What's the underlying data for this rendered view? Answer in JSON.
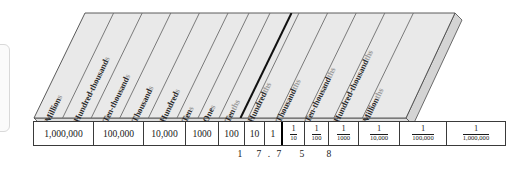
{
  "figure": {
    "colors": {
      "slab_top": "#e9e9e9",
      "slab_side": "#d8d8d8",
      "slab_front": "#e2e2e2",
      "rule_line": "#6d6d6d",
      "decimal_rule": "#111111",
      "outline": "#3a3a3a",
      "label_text": "#2b2b2b",
      "label_suffix": "#9b9b9b",
      "page_background": "#ffffff"
    },
    "decimal_point_marker": "thick-dark-line-between-ones-and-tenths"
  },
  "place_values": [
    {
      "name": "Millions",
      "stem": "Million",
      "suffix": "s",
      "value": "1,000,000",
      "kind": "whole",
      "digit": ""
    },
    {
      "name": "Hundred-thousands",
      "stem": "Hundred-thousand",
      "suffix": "s",
      "value": "100,000",
      "kind": "whole",
      "digit": ""
    },
    {
      "name": "Ten-thousands",
      "stem": "Ten-thousand",
      "suffix": "s",
      "value": "10,000",
      "kind": "whole",
      "digit": ""
    },
    {
      "name": "Thousands",
      "stem": "Thousand",
      "suffix": "s",
      "value": "1000",
      "kind": "whole",
      "digit": ""
    },
    {
      "name": "Hundreds",
      "stem": "Hundred",
      "suffix": "s",
      "value": "100",
      "kind": "whole",
      "digit": ""
    },
    {
      "name": "Tens",
      "stem": "Ten",
      "suffix": "s",
      "value": "10",
      "kind": "whole",
      "digit": "1"
    },
    {
      "name": "Ones",
      "stem": "One",
      "suffix": "s",
      "value": "1",
      "kind": "whole",
      "digit": "7"
    },
    {
      "name": "Tenths",
      "stem": "Ten",
      "suffix": "ths",
      "numerator": "1",
      "denominator": "10",
      "kind": "fraction",
      "digit": "7"
    },
    {
      "name": "Hundredths",
      "stem": "Hundred",
      "suffix": "ths",
      "numerator": "1",
      "denominator": "100",
      "kind": "fraction",
      "digit": "5"
    },
    {
      "name": "Thousandths",
      "stem": "Thousand",
      "suffix": "ths",
      "numerator": "1",
      "denominator": "1000",
      "kind": "fraction",
      "digit": "8"
    },
    {
      "name": "Ten-thousandths",
      "stem": "Ten-thousand",
      "suffix": "ths",
      "numerator": "1",
      "denominator": "10,000",
      "kind": "fraction",
      "digit": ""
    },
    {
      "name": "Hundred-thousandths",
      "stem": "Hundred-thousand",
      "suffix": "ths",
      "numerator": "1",
      "denominator": "100,000",
      "kind": "fraction",
      "digit": ""
    },
    {
      "name": "Millionths",
      "stem": "Million",
      "suffix": "ths",
      "numerator": "1",
      "denominator": "1,000,000",
      "kind": "fraction",
      "digit": ""
    }
  ],
  "example_number": {
    "text": "17.758",
    "decimal_point": ".",
    "digits": [
      "1",
      "7",
      ".",
      "7",
      "5",
      "8"
    ]
  }
}
